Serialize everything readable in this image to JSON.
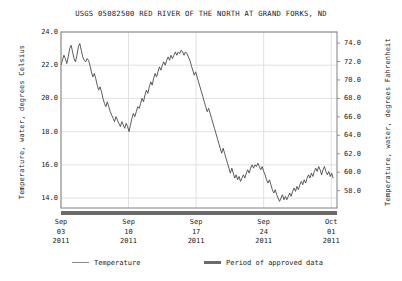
{
  "title": "USGS 05082500 RED RIVER OF THE NORTH AT GRAND FORKS, ND",
  "axes": {
    "left_label": "Temperature, water, degrees Celsius",
    "right_label": "Temperature, water, degrees Fahrenheit"
  },
  "legend": {
    "temperature": "Temperature",
    "approved": "Period of approved data"
  },
  "colors": {
    "line": "#4a4a4a",
    "approved_bar": "#6b6b6b",
    "grid": "#d9d9d9",
    "frame": "#808080",
    "text": "#1a1a1a",
    "background": "#ffffff"
  },
  "chart_data": {
    "type": "line",
    "title": "USGS 05082500 RED RIVER OF THE NORTH AT GRAND FORKS, ND",
    "xlabel": "",
    "ylabel": "Temperature, water, degrees Celsius",
    "ylabel_secondary": "Temperature, water, degrees Fahrenheit",
    "grid": true,
    "legend_position": "below",
    "ylim": [
      13.4,
      24.0
    ],
    "yticks": [
      "24.0",
      "22.0",
      "20.0",
      "18.0",
      "16.0",
      "14.0"
    ],
    "ytick_values": [
      24.0,
      22.0,
      20.0,
      18.0,
      16.0,
      14.0
    ],
    "yticks_secondary": [
      "74.0",
      "72.0",
      "70.0",
      "68.0",
      "66.0",
      "64.0",
      "62.0",
      "60.0",
      "58.0",
      "56.0"
    ],
    "ytick_values_secondary": [
      74.0,
      72.0,
      70.0,
      68.0,
      66.0,
      64.0,
      62.0,
      60.0,
      58.0,
      56.0
    ],
    "xticks": [
      {
        "line1": "Sep",
        "line2": "03",
        "line3": "2011",
        "day": 0
      },
      {
        "line1": "Sep",
        "line2": "10",
        "line3": "2011",
        "day": 7
      },
      {
        "line1": "Sep",
        "line2": "17",
        "line3": "2011",
        "day": 14
      },
      {
        "line1": "Sep",
        "line2": "24",
        "line3": "2011",
        "day": 21
      },
      {
        "line1": "Oct",
        "line2": "01",
        "line3": "2011",
        "day": 28
      }
    ],
    "xlim_days": [
      0,
      28.6
    ],
    "series": [
      {
        "name": "Temperature",
        "unit": "degrees Celsius",
        "x_days": [
          0.0,
          0.15,
          0.3,
          0.45,
          0.6,
          0.75,
          0.9,
          1.05,
          1.2,
          1.35,
          1.5,
          1.65,
          1.8,
          1.95,
          2.1,
          2.25,
          2.4,
          2.55,
          2.7,
          2.85,
          3.0,
          3.15,
          3.3,
          3.45,
          3.6,
          3.75,
          3.9,
          4.05,
          4.2,
          4.35,
          4.5,
          4.65,
          4.8,
          4.95,
          5.1,
          5.25,
          5.4,
          5.55,
          5.7,
          5.85,
          6.0,
          6.15,
          6.3,
          6.45,
          6.6,
          6.75,
          6.9,
          7.05,
          7.2,
          7.35,
          7.5,
          7.65,
          7.8,
          7.95,
          8.1,
          8.25,
          8.4,
          8.55,
          8.7,
          8.85,
          9.0,
          9.15,
          9.3,
          9.45,
          9.6,
          9.75,
          9.9,
          10.05,
          10.2,
          10.35,
          10.5,
          10.65,
          10.8,
          10.95,
          11.1,
          11.25,
          11.4,
          11.55,
          11.7,
          11.85,
          12.0,
          12.15,
          12.3,
          12.45,
          12.6,
          12.75,
          12.9,
          13.05,
          13.2,
          13.35,
          13.5,
          13.65,
          13.8,
          13.95,
          14.1,
          14.25,
          14.4,
          14.55,
          14.7,
          14.85,
          15.0,
          15.15,
          15.3,
          15.45,
          15.6,
          15.75,
          15.9,
          16.05,
          16.2,
          16.35,
          16.5,
          16.65,
          16.8,
          16.95,
          17.1,
          17.25,
          17.4,
          17.55,
          17.7,
          17.85,
          18.0,
          18.15,
          18.3,
          18.45,
          18.6,
          18.75,
          18.9,
          19.05,
          19.2,
          19.35,
          19.5,
          19.65,
          19.8,
          19.95,
          20.1,
          20.25,
          20.4,
          20.55,
          20.7,
          20.85,
          21.0,
          21.15,
          21.3,
          21.45,
          21.6,
          21.75,
          21.9,
          22.05,
          22.2,
          22.35,
          22.5,
          22.65,
          22.8,
          22.95,
          23.1,
          23.25,
          23.4,
          23.55,
          23.7,
          23.85,
          24.0,
          24.15,
          24.3,
          24.45,
          24.6,
          24.75,
          24.9,
          25.05,
          25.2,
          25.35,
          25.5,
          25.65,
          25.8,
          25.95,
          26.1,
          26.25,
          26.4,
          26.55,
          26.7,
          26.85,
          27.0,
          27.15,
          27.3,
          27.45,
          27.6,
          27.75,
          27.9,
          28.05,
          28.2,
          28.35,
          28.5
        ],
        "y_celsius": [
          22.0,
          22.3,
          22.6,
          22.4,
          22.1,
          22.5,
          23.0,
          23.2,
          22.8,
          22.4,
          22.2,
          22.6,
          23.1,
          23.3,
          22.9,
          22.5,
          22.3,
          22.2,
          22.4,
          22.3,
          22.0,
          21.6,
          21.3,
          21.5,
          21.2,
          20.8,
          20.5,
          20.7,
          20.4,
          20.0,
          19.7,
          19.5,
          19.8,
          19.5,
          19.2,
          19.0,
          18.8,
          18.6,
          18.9,
          18.7,
          18.5,
          18.3,
          18.6,
          18.4,
          18.2,
          18.5,
          18.3,
          18.0,
          18.4,
          18.8,
          19.1,
          18.9,
          19.2,
          19.5,
          19.4,
          19.7,
          20.0,
          19.8,
          20.2,
          20.5,
          20.3,
          20.7,
          21.0,
          20.8,
          21.2,
          21.5,
          21.3,
          21.6,
          21.9,
          21.7,
          22.0,
          22.2,
          22.0,
          22.3,
          22.5,
          22.3,
          22.6,
          22.4,
          22.6,
          22.8,
          22.6,
          22.8,
          22.7,
          22.9,
          22.8,
          22.6,
          22.8,
          22.7,
          22.5,
          22.3,
          22.0,
          21.7,
          21.4,
          21.6,
          21.3,
          21.0,
          20.7,
          20.4,
          20.1,
          19.8,
          19.5,
          19.2,
          19.4,
          19.1,
          18.8,
          18.5,
          18.2,
          17.9,
          17.6,
          17.3,
          17.0,
          16.7,
          17.0,
          16.7,
          16.4,
          16.1,
          15.8,
          15.5,
          15.8,
          15.5,
          15.2,
          15.4,
          15.1,
          15.3,
          15.0,
          15.2,
          15.4,
          15.2,
          15.5,
          15.7,
          15.5,
          15.8,
          16.0,
          15.8,
          16.0,
          15.9,
          16.1,
          15.9,
          15.7,
          15.9,
          15.6,
          15.4,
          15.1,
          14.9,
          15.1,
          14.8,
          14.5,
          14.3,
          14.5,
          14.2,
          14.0,
          13.8,
          14.0,
          14.2,
          13.9,
          14.1,
          13.9,
          14.1,
          14.3,
          14.1,
          14.4,
          14.6,
          14.4,
          14.7,
          14.5,
          14.8,
          15.0,
          14.8,
          15.1,
          14.9,
          15.2,
          15.4,
          15.2,
          15.5,
          15.3,
          15.6,
          15.8,
          15.6,
          15.9,
          15.7,
          15.4,
          15.7,
          15.9,
          15.6,
          15.4,
          15.6,
          15.3,
          15.5,
          15.2
        ]
      }
    ],
    "approved_period": {
      "label": "Period of approved data",
      "start_day": 0,
      "end_day": 28.6
    }
  }
}
